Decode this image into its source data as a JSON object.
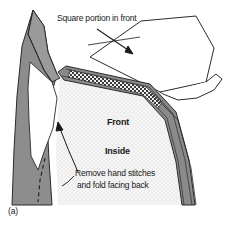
{
  "figure": {
    "label": "(a)",
    "type": "technical sewing illustration",
    "annotations": {
      "square_portion": "Square portion in front",
      "front": "Front",
      "inside": "Inside",
      "remove_line1": "Remove hand stitches",
      "remove_line2": "and fold facing back"
    },
    "colors": {
      "garment_gray": "#8d8d8d",
      "band_gray": "#8a8a8a",
      "fill_white": "#ffffff",
      "stipple": "#efefef",
      "outline": "#2b2b2b",
      "background": "#ffffff",
      "text": "#1a1a1a"
    },
    "icons": {
      "square_arrow": "arrow-down-right-icon",
      "facing_arrow": "arrow-up-left-icon",
      "stitch_band": "hatched-stitch-icon",
      "fold_line": "dashed-fold-line-icon"
    }
  }
}
